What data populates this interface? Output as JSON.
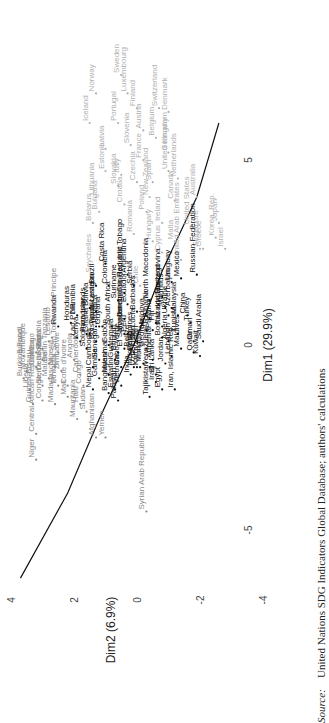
{
  "chart_data": {
    "type": "scatter",
    "title": "",
    "xlabel": "Dim1 (29.9%)",
    "ylabel": "Dim2 (6.9%)",
    "xlim": [
      -6.5,
      7.5
    ],
    "ylim": [
      -4.5,
      4.5
    ],
    "xticks": [
      "-5",
      "0",
      "5"
    ],
    "xtick_values": [
      -5,
      0,
      5
    ],
    "yticks": [
      "-4",
      "-2",
      "0",
      "2",
      "4"
    ],
    "ytick_values": [
      -4,
      -2,
      0,
      2,
      4
    ],
    "orientation": "rotated-90-counterclockwise",
    "curve": {
      "name": "fitted-curve",
      "points": [
        [
          -6.3,
          3.7
        ],
        [
          -4,
          2.2
        ],
        [
          -2,
          1.2
        ],
        [
          0,
          0.1
        ],
        [
          2,
          -0.8
        ],
        [
          4,
          -1.9
        ],
        [
          6,
          -2.6
        ]
      ]
    },
    "series": [
      {
        "name": "high",
        "color": "#b0b0b0",
        "points": [
          [
            "Sweden",
            7.3,
            0.5
          ],
          [
            "Norway",
            6.8,
            1.3
          ],
          [
            "Luxembourg",
            6.8,
            0.3
          ],
          [
            "Finland",
            6.4,
            0.0
          ],
          [
            "Iceland",
            6.0,
            1.5
          ],
          [
            "Portugal",
            6.0,
            0.6
          ],
          [
            "Switzerland",
            6.4,
            -0.7
          ],
          [
            "Austria",
            5.8,
            -0.2
          ],
          [
            "Denmark",
            6.3,
            -1.0
          ],
          [
            "Latvia",
            5.3,
            1.0
          ],
          [
            "Slovenia",
            5.4,
            0.2
          ],
          [
            "Belgium",
            5.6,
            -0.6
          ],
          [
            "Estonia",
            4.7,
            1.0
          ],
          [
            "Italy",
            4.6,
            0.5
          ],
          [
            "France",
            5.0,
            -0.2
          ],
          [
            "Germany",
            5.2,
            -1.0
          ],
          [
            "Lithuania",
            4.0,
            1.3
          ],
          [
            "Slovakia",
            4.3,
            0.6
          ],
          [
            "Czechia",
            4.4,
            0.0
          ],
          [
            "United Kingdom",
            4.7,
            -1.0
          ],
          [
            "Bulgaria",
            3.6,
            1.2
          ],
          [
            "Croatia",
            3.8,
            0.4
          ],
          [
            "New Zealand",
            4.0,
            -0.4
          ],
          [
            "Spain",
            4.4,
            -0.5
          ],
          [
            "Netherlands",
            4.5,
            -1.3
          ],
          [
            "Belarus",
            3.3,
            1.4
          ],
          [
            "Poland",
            3.6,
            -0.3
          ],
          [
            "Canada",
            3.9,
            -1.2
          ],
          [
            "Romania",
            3.0,
            0.1
          ],
          [
            "Ireland",
            3.3,
            -0.8
          ],
          [
            "Australia",
            4.0,
            -1.9
          ],
          [
            "Hungary",
            2.8,
            -0.5
          ],
          [
            "United States",
            3.2,
            -1.7
          ],
          [
            "Cyprus",
            2.5,
            -0.8
          ],
          [
            "Malta",
            2.8,
            -1.2
          ],
          [
            "Singapore",
            2.6,
            -2.0
          ],
          [
            "Korea, Rep.",
            2.9,
            -2.5
          ],
          [
            "United Arab Emirates",
            2.3,
            -1.4
          ],
          [
            "Greece",
            2.6,
            -2.1
          ],
          [
            "Japan",
            3.3,
            -2.6
          ],
          [
            "Israel",
            2.6,
            -2.8
          ],
          [
            "Seychelles",
            1.9,
            1.4
          ],
          [
            "Chile",
            1.6,
            -0.1
          ]
        ]
      },
      {
        "name": "middle",
        "color": "#111111",
        "points": [
          [
            "Costa Rica",
            2.2,
            1.0
          ],
          [
            "Brazil",
            1.6,
            1.3
          ],
          [
            "Colombia",
            1.6,
            0.9
          ],
          [
            "Argentina",
            1.9,
            0.3
          ],
          [
            "Serbia",
            1.6,
            0.1
          ],
          [
            "Trinidad and Tobago",
            1.4,
            0.4
          ],
          [
            "Suriname",
            1.2,
            0.6
          ],
          [
            "Ecuador",
            1.1,
            0.3
          ],
          [
            "Barbados",
            0.9,
            0.0
          ],
          [
            "North Macedonia",
            1.2,
            -0.4
          ],
          [
            "Thailand",
            1.3,
            -0.8
          ],
          [
            "Uruguay",
            1.7,
            -1.1
          ],
          [
            "Mexico",
            1.8,
            -1.4
          ],
          [
            "Russian Federation",
            1.9,
            -1.9
          ],
          [
            "Azerbaijan",
            1.0,
            -1.1
          ],
          [
            "Mauritius",
            1.0,
            -0.9
          ],
          [
            "Malaysia",
            0.8,
            -1.3
          ],
          [
            "China",
            0.8,
            -1.6
          ],
          [
            "Turkey",
            0.6,
            -1.7
          ],
          [
            "Saudi Arabia",
            0.1,
            -2.1
          ],
          [
            "Kuwait",
            -0.3,
            -2.0
          ],
          [
            "Oman",
            0.1,
            -1.8
          ],
          [
            "Qatar",
            -0.2,
            -1.8
          ],
          [
            "Maldives",
            -0.1,
            -1.4
          ],
          [
            "Tunisia",
            0.3,
            -1.3
          ],
          [
            "Lebanon",
            -0.3,
            -1.1
          ],
          [
            "Ukraine",
            0.8,
            -1.0
          ],
          [
            "Kazakhstan",
            0.5,
            -0.8
          ],
          [
            "Fiji",
            0.6,
            -0.6
          ],
          [
            "Algeria",
            0.1,
            -1.0
          ],
          [
            "Bosnia and Herzegovina",
            0.2,
            -0.8
          ],
          [
            "Panama",
            0.4,
            -0.5
          ],
          [
            "Albania",
            0.7,
            -0.4
          ],
          [
            "Moldova",
            0.4,
            -0.3
          ],
          [
            "St. Lucia",
            0.1,
            0.0
          ],
          [
            "Peru",
            0.3,
            0.3
          ],
          [
            "Dominican Republic",
            0.7,
            0.4
          ],
          [
            "Montenegro",
            0.3,
            0.4
          ],
          [
            "South Africa",
            0.5,
            0.8
          ],
          [
            "Guyana",
            0.5,
            1.1
          ],
          [
            "Jamaica",
            0.5,
            1.2
          ],
          [
            "Nicaragua",
            0.9,
            1.3
          ],
          [
            "Bolivia",
            1.0,
            1.5
          ],
          [
            "Paraguay",
            0.3,
            1.6
          ],
          [
            "Namibia",
            0.8,
            1.9
          ],
          [
            "Honduras",
            0.6,
            2.1
          ],
          [
            "El Salvador",
            -0.1,
            0.4
          ],
          [
            "Belize",
            -0.1,
            0.2
          ],
          [
            "Georgia",
            -0.1,
            -0.3
          ],
          [
            "Armenia",
            -0.4,
            -0.5
          ],
          [
            "Jordan",
            -0.5,
            -0.9
          ],
          [
            "Mongolia",
            -0.5,
            -0.2
          ],
          [
            "Kyrgyzstan",
            -0.6,
            -0.1
          ],
          [
            "Venezuela, RB",
            -0.6,
            -0.4
          ],
          [
            "Sri Lanka",
            -0.8,
            -0.6
          ],
          [
            "Iran, Islamic Rep.",
            -1.2,
            -1.2
          ],
          [
            "Egypt",
            -1.2,
            -0.8
          ],
          [
            "Iraq",
            -1.0,
            -0.6
          ],
          [
            "Tajikistan",
            -1.4,
            -0.4
          ],
          [
            "Philippines",
            -0.2,
            0.1
          ],
          [
            "Uzbekistan",
            -0.6,
            0.0
          ],
          [
            "Indonesia",
            -0.6,
            0.1
          ],
          [
            "India",
            -0.8,
            0.2
          ],
          [
            "Vietnam",
            -1.1,
            0.5
          ],
          [
            "Cabo Verde",
            -0.6,
            0.5
          ],
          [
            "Guatemala",
            -0.4,
            0.7
          ],
          [
            "Bhutan",
            -0.2,
            0.6
          ],
          [
            "Gabon",
            0.0,
            0.9
          ],
          [
            "Botswana",
            0.1,
            1.3
          ],
          [
            "Timor-Leste",
            0.5,
            1.3
          ],
          [
            "Ghana",
            0.3,
            1.5
          ],
          [
            "Eswatini",
            -1.2,
            0.7
          ],
          [
            "Myanmar",
            -0.8,
            0.9
          ],
          [
            "Bangladesh",
            -1.3,
            0.9
          ],
          [
            "Pakistan",
            -1.5,
            0.6
          ],
          [
            "Senegal",
            -0.4,
            1.2
          ],
          [
            "Gambia",
            -0.9,
            1.2
          ],
          [
            "Nepal",
            -1.2,
            1.4
          ],
          [
            "Cambodia",
            -0.6,
            1.4
          ],
          [
            "Solomon Islands",
            -0.1,
            1.6
          ],
          [
            "Kenya",
            0.1,
            1.8
          ],
          [
            "Lao PDR",
            0.2,
            1.9
          ],
          [
            "Rwanda",
            0.5,
            2.5
          ]
        ]
      },
      {
        "name": "low",
        "color": "#888888",
        "points": [
          [
            "Cameroon",
            -0.8,
            1.8
          ],
          [
            "Angola",
            -0.4,
            2.0
          ],
          [
            "Congo",
            -1.1,
            1.7
          ],
          [
            "Haiti",
            -1.6,
            1.8
          ],
          [
            "Mali",
            -1.4,
            2.2
          ],
          [
            "Cote d'Ivoire",
            -1.1,
            2.2
          ],
          [
            "Zimbabwe",
            -0.7,
            2.4
          ],
          [
            "Ethiopia",
            -1.1,
            2.5
          ],
          [
            "Nigeria",
            -0.6,
            2.6
          ],
          [
            "Malawi",
            -0.9,
            2.8
          ],
          [
            "Sao Tome and Principe",
            -0.2,
            2.5
          ],
          [
            "Lesotho",
            0.2,
            2.7
          ],
          [
            "Benin",
            -0.5,
            2.8
          ],
          [
            "Uganda",
            -0.4,
            3.0
          ],
          [
            "Togo",
            -0.2,
            3.2
          ],
          [
            "Guinea",
            -0.6,
            3.2
          ],
          [
            "Sierra Leone",
            -1.1,
            3.0
          ],
          [
            "Zambia",
            -0.1,
            3.0
          ],
          [
            "Tanzania",
            0.1,
            2.8
          ],
          [
            "Burundi",
            -0.3,
            3.6
          ],
          [
            "Mozambique",
            -0.7,
            3.5
          ],
          [
            "Burkina Faso",
            -0.9,
            3.6
          ],
          [
            "Liberia",
            -1.2,
            3.4
          ],
          [
            "Guinea-Bissau",
            -1.6,
            3.3
          ],
          [
            "Congo, Dem. Rep.",
            -1.5,
            3.0
          ],
          [
            "Madagascar",
            -1.6,
            2.6
          ],
          [
            "Central African Republic",
            -2.4,
            3.2
          ],
          [
            "Niger",
            -3.1,
            3.2
          ],
          [
            "Mauritania",
            -2.0,
            1.9
          ],
          [
            "Sudan",
            -1.8,
            1.6
          ],
          [
            "Afghanistan",
            -2.5,
            1.3
          ],
          [
            "Yemen",
            -2.5,
            1.0
          ],
          [
            "Syrian Arab Republic",
            -4.5,
            -0.3
          ]
        ]
      }
    ]
  },
  "source": {
    "label": "Source:",
    "text": "United Nations SDG Indicators Global Database; authors' calculations"
  }
}
